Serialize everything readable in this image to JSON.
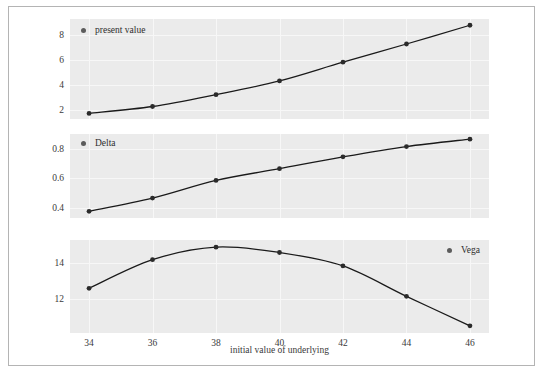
{
  "figure": {
    "background": "#ffffff",
    "panel_background": "#ebebeb",
    "gridline_color": "#f7f7f7",
    "line_color": "#1a1a1a",
    "marker_color": "#2b2b2b",
    "legend_marker_color": "#5c5c5c",
    "frame_color": "#b4b4b4",
    "xlabel": "initial value of underlying"
  },
  "chart_data": [
    {
      "type": "line",
      "panel": 1,
      "title": "",
      "legend": "present value",
      "legend_position": "top-left",
      "xlabel": "",
      "ylabel": "",
      "x": [
        34,
        36,
        38,
        40,
        42,
        44,
        46
      ],
      "values": [
        1.75,
        2.3,
        3.25,
        4.35,
        5.85,
        7.3,
        8.8
      ],
      "xticks": [
        34,
        36,
        38,
        40,
        42,
        44,
        46
      ],
      "yticks": [
        2,
        4,
        6,
        8
      ],
      "ytick_labels": [
        "2",
        "4",
        "6",
        "8"
      ],
      "xlim": [
        33.4,
        46.6
      ],
      "ylim": [
        1.3,
        9.3
      ],
      "grid": true,
      "markers": true
    },
    {
      "type": "line",
      "panel": 2,
      "title": "",
      "legend": "Delta",
      "legend_position": "top-left",
      "xlabel": "",
      "ylabel": "",
      "x": [
        34,
        36,
        38,
        40,
        42,
        44,
        46
      ],
      "values": [
        0.375,
        0.465,
        0.585,
        0.665,
        0.745,
        0.815,
        0.865
      ],
      "xticks": [
        34,
        36,
        38,
        40,
        42,
        44,
        46
      ],
      "yticks": [
        0.4,
        0.6,
        0.8
      ],
      "ytick_labels": [
        "0.4",
        "0.6",
        "0.8"
      ],
      "xlim": [
        33.4,
        46.6
      ],
      "ylim": [
        0.33,
        0.9
      ],
      "grid": true,
      "markers": true
    },
    {
      "type": "line",
      "panel": 3,
      "title": "",
      "legend": "Vega",
      "legend_position": "top-right",
      "xlabel": "initial value of underlying",
      "ylabel": "",
      "x": [
        34,
        36,
        38,
        40,
        42,
        44,
        46
      ],
      "values": [
        12.6,
        14.2,
        14.9,
        14.6,
        13.85,
        12.15,
        10.5
      ],
      "xticks": [
        34,
        36,
        38,
        40,
        42,
        44,
        46
      ],
      "xtick_labels": [
        "34",
        "36",
        "38",
        "40",
        "42",
        "44",
        "46"
      ],
      "yticks": [
        12,
        14
      ],
      "ytick_labels": [
        "12",
        "14"
      ],
      "xlim": [
        33.4,
        46.6
      ],
      "ylim": [
        10.1,
        15.3
      ],
      "grid": true,
      "markers": true
    }
  ]
}
